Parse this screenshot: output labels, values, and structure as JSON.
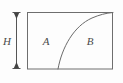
{
  "figure": {
    "type": "geometry-diagram",
    "canvas": {
      "width": 123,
      "height": 83,
      "background_color": "#fdfdfd"
    },
    "colors": {
      "stroke": "#6e6e6e",
      "curve": "#6b6b6b",
      "label": "#4a4a4a",
      "dimension": "#555555"
    },
    "rectangle": {
      "name": "bounding-rectangle",
      "left": 27,
      "top": 12,
      "right": 113,
      "bottom": 69,
      "stroke_width": 1
    },
    "dimension": {
      "name": "height-dimension",
      "label": "H",
      "axis_x": 16,
      "top_y": 12,
      "bottom_y": 68,
      "label_x": 7,
      "label_y": 42,
      "tick_half_width": 4
    },
    "curve": {
      "name": "dividing-curve",
      "shape": "concave-down-increasing",
      "path": "M 58 69 C 62 47 74 26 92 18 C 99 15 106 13 113 12",
      "start_point": [
        58,
        69
      ],
      "end_point": [
        113,
        12
      ],
      "stroke_width": 1
    },
    "regions": [
      {
        "id": "A",
        "label": "A",
        "label_x": 46,
        "label_y": 42,
        "side": "left"
      },
      {
        "id": "B",
        "label": "B",
        "label_x": 90,
        "label_y": 42,
        "side": "right"
      }
    ]
  }
}
